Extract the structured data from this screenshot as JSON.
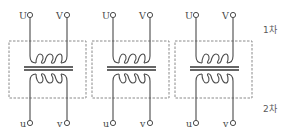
{
  "diagram": {
    "type": "single-phase transformers x3 (circuit schematic)",
    "colors": {
      "line": "#4a4a4a",
      "box": "#8a8a8a",
      "background": "#ffffff"
    },
    "side_labels": {
      "primary": "1차",
      "secondary": "2차"
    },
    "transformers": [
      {
        "id": "T1",
        "primary": {
          "left": "U",
          "right": "V"
        },
        "secondary": {
          "left": "u",
          "right": "v"
        }
      },
      {
        "id": "T2",
        "primary": {
          "left": "U",
          "right": "V"
        },
        "secondary": {
          "left": "u",
          "right": "v"
        }
      },
      {
        "id": "T3",
        "primary": {
          "left": "U",
          "right": "V"
        },
        "secondary": {
          "left": "u",
          "right": "v"
        }
      }
    ]
  }
}
